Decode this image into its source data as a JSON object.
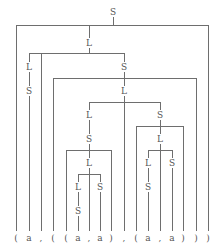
{
  "figure": {
    "name": "syntax-parse-tree",
    "line_color": "#6e6e6e",
    "text_color": "#555555",
    "background": "#ffffff",
    "width": 219,
    "height": 252
  },
  "terminals": [
    {
      "id": "t0",
      "label": "(",
      "x": 16,
      "top": 25
    },
    {
      "id": "t1",
      "label": "a",
      "x": 29,
      "top": 99
    },
    {
      "id": "t2",
      "label": ",",
      "x": 41,
      "top": 53
    },
    {
      "id": "t3",
      "label": "(",
      "x": 53,
      "top": 78
    },
    {
      "id": "t4",
      "label": "(",
      "x": 66,
      "top": 150
    },
    {
      "id": "t5",
      "label": "a",
      "x": 78,
      "top": 219
    },
    {
      "id": "t6",
      "label": ",",
      "x": 89,
      "top": 174
    },
    {
      "id": "t7",
      "label": "a",
      "x": 100,
      "top": 195
    },
    {
      "id": "t8",
      "label": ")",
      "x": 111,
      "top": 150
    },
    {
      "id": "t9",
      "label": ",",
      "x": 124,
      "top": 102
    },
    {
      "id": "t10",
      "label": "(",
      "x": 136,
      "top": 150
    },
    {
      "id": "t11",
      "label": "a",
      "x": 148,
      "top": 219
    },
    {
      "id": "t12",
      "label": ",",
      "x": 160,
      "top": 174
    },
    {
      "id": "t13",
      "label": "a",
      "x": 172,
      "top": 195
    },
    {
      "id": "t14",
      "label": ")",
      "x": 183,
      "top": 150
    },
    {
      "id": "t15",
      "label": ")",
      "x": 196,
      "top": 78
    },
    {
      "id": "t16",
      "label": ")",
      "x": 208,
      "top": 25
    }
  ],
  "terminal_string": "( a , ( ( a , a ) , ( a , a ) ) )",
  "nodes": [
    {
      "id": "n1",
      "label": "S",
      "x": 113,
      "y": 12
    },
    {
      "id": "n2",
      "label": "L",
      "x": 89,
      "y": 43
    },
    {
      "id": "n3",
      "label": "L",
      "x": 29,
      "y": 67
    },
    {
      "id": "n4",
      "label": "S",
      "x": 29,
      "y": 91
    },
    {
      "id": "n5",
      "label": "S",
      "x": 124,
      "y": 67
    },
    {
      "id": "n6",
      "label": "L",
      "x": 124,
      "y": 91
    },
    {
      "id": "n7",
      "label": "L",
      "x": 89,
      "y": 115
    },
    {
      "id": "n8",
      "label": "S",
      "x": 89,
      "y": 139
    },
    {
      "id": "n9",
      "label": "L",
      "x": 89,
      "y": 163
    },
    {
      "id": "n10",
      "label": "L",
      "x": 78,
      "y": 187
    },
    {
      "id": "n11",
      "label": "S",
      "x": 100,
      "y": 187
    },
    {
      "id": "n12",
      "label": "S",
      "x": 78,
      "y": 211
    },
    {
      "id": "n13",
      "label": "S",
      "x": 160,
      "y": 115
    },
    {
      "id": "n14",
      "label": "L",
      "x": 160,
      "y": 139
    },
    {
      "id": "n15",
      "label": "L",
      "x": 148,
      "y": 163
    },
    {
      "id": "n16",
      "label": "S",
      "x": 172,
      "y": 163
    },
    {
      "id": "n17",
      "label": "S",
      "x": 148,
      "y": 187
    }
  ],
  "baseline_y": 237,
  "node_labels_sequence": [
    "S",
    "L",
    "L",
    "S",
    "S",
    "L",
    "L",
    "S",
    "L",
    "L",
    "S",
    "S",
    "S",
    "L",
    "L",
    "S",
    "S"
  ]
}
